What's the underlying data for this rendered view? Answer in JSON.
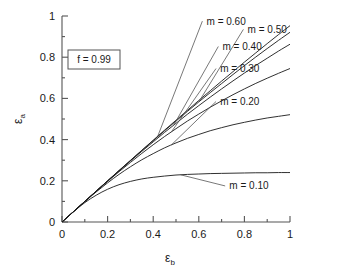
{
  "chart_data": {
    "type": "line",
    "title": "",
    "xlabel": "εb",
    "ylabel": "εa",
    "xlabel_base": "ε",
    "xlabel_sub": "b",
    "ylabel_base": "ε",
    "ylabel_sub": "a",
    "xlim": [
      0,
      1
    ],
    "ylim": [
      0,
      1
    ],
    "xticks": [
      0,
      0.2,
      0.4,
      0.6,
      0.8,
      1
    ],
    "yticks": [
      0,
      0.2,
      0.4,
      0.6,
      0.8,
      1
    ],
    "xtick_labels": [
      "0",
      "0.2",
      "0.4",
      "0.6",
      "0.8",
      "1"
    ],
    "ytick_labels": [
      "0",
      "0.2",
      "0.4",
      "0.6",
      "0.8",
      "1"
    ],
    "minor_tick_step": 0.1,
    "grid": false,
    "legend_position": "inline-curve-labels",
    "line_color": "#1a1a1a",
    "axis_color": "#555555",
    "annotations": [
      {
        "text": "f = 0.99",
        "boxed": true,
        "x": 0.22,
        "y": 0.83
      }
    ],
    "x": [
      0,
      0.05,
      0.1,
      0.15,
      0.2,
      0.25,
      0.3,
      0.35,
      0.4,
      0.45,
      0.5,
      0.55,
      0.6,
      0.65,
      0.7,
      0.75,
      0.8,
      0.85,
      0.9,
      0.95,
      1
    ],
    "series": [
      {
        "name": "m = 0.10",
        "m": 0.1,
        "label": "m = 0.10",
        "label_x": 0.82,
        "label_y": 0.175,
        "values": [
          0,
          0.049,
          0.094,
          0.13,
          0.159,
          0.181,
          0.197,
          0.209,
          0.217,
          0.223,
          0.228,
          0.231,
          0.233,
          0.235,
          0.236,
          0.237,
          0.238,
          0.239,
          0.239,
          0.24,
          0.24
        ]
      },
      {
        "name": "m = 0.20",
        "m": 0.2,
        "label": "m = 0.20",
        "label_x": 0.78,
        "label_y": 0.585,
        "values": [
          0,
          0.05,
          0.099,
          0.146,
          0.19,
          0.231,
          0.268,
          0.302,
          0.332,
          0.36,
          0.384,
          0.406,
          0.425,
          0.443,
          0.458,
          0.472,
          0.484,
          0.495,
          0.505,
          0.513,
          0.521
        ]
      },
      {
        "name": "m = 0.30",
        "m": 0.3,
        "label": "m = 0.30",
        "label_x": 0.78,
        "label_y": 0.745,
        "values": [
          0,
          0.05,
          0.1,
          0.149,
          0.197,
          0.244,
          0.289,
          0.333,
          0.375,
          0.415,
          0.453,
          0.49,
          0.524,
          0.557,
          0.588,
          0.618,
          0.646,
          0.673,
          0.698,
          0.722,
          0.745
        ]
      },
      {
        "name": "m = 0.40",
        "m": 0.4,
        "label": "m = 0.40",
        "label_x": 0.79,
        "label_y": 0.852,
        "values": [
          0,
          0.05,
          0.1,
          0.15,
          0.199,
          0.248,
          0.296,
          0.343,
          0.389,
          0.435,
          0.479,
          0.523,
          0.565,
          0.606,
          0.646,
          0.685,
          0.723,
          0.76,
          0.795,
          0.83,
          0.863
        ]
      },
      {
        "name": "m = 0.50",
        "m": 0.5,
        "label": "m = 0.50",
        "label_x": 0.9,
        "label_y": 0.935,
        "values": [
          0,
          0.05,
          0.1,
          0.15,
          0.2,
          0.249,
          0.298,
          0.347,
          0.395,
          0.443,
          0.49,
          0.537,
          0.583,
          0.628,
          0.672,
          0.716,
          0.759,
          0.801,
          0.842,
          0.882,
          0.921
        ]
      },
      {
        "name": "m = 0.60",
        "m": 0.6,
        "label": "m = 0.60",
        "label_x": 0.72,
        "label_y": 0.975,
        "values": [
          0,
          0.05,
          0.1,
          0.15,
          0.2,
          0.25,
          0.299,
          0.348,
          0.397,
          0.446,
          0.494,
          0.542,
          0.59,
          0.637,
          0.684,
          0.73,
          0.776,
          0.821,
          0.866,
          0.91,
          0.953
        ]
      }
    ]
  }
}
